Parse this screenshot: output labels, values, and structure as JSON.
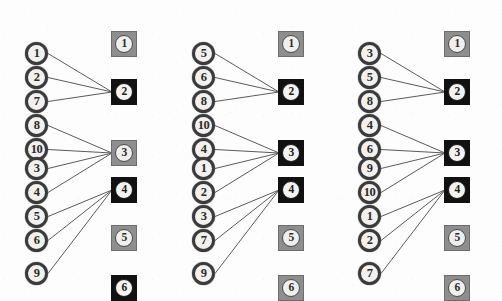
{
  "figure": {
    "type": "bipartite-matching-diagram",
    "panel_count": 3,
    "left_node_shape": "circle",
    "right_node_shape": "square",
    "colors": {
      "node_fill": "#f2f1ef",
      "node_border": "#3b3b3b",
      "square_gray": "#8e8e8e",
      "square_black": "#111111",
      "edge": "#5a5a5a",
      "background": "#ffffff"
    },
    "geometry": {
      "canvas_width": 502,
      "canvas_height": 301,
      "panel_x_offsets": [
        0,
        167,
        333
      ],
      "left_node_x": 25,
      "left_node_y": [
        42,
        66,
        90,
        114,
        138,
        157,
        181,
        205,
        229,
        262
      ],
      "square_x": 111,
      "square_y": [
        31,
        79,
        140,
        177,
        225,
        275
      ]
    }
  },
  "panels": [
    {
      "id": "panel-1",
      "left_nodes": [
        {
          "label": "1"
        },
        {
          "label": "2"
        },
        {
          "label": "7"
        },
        {
          "label": "8"
        },
        {
          "label": "10"
        },
        {
          "label": "3"
        },
        {
          "label": "4"
        },
        {
          "label": "5"
        },
        {
          "label": "6"
        },
        {
          "label": "9"
        }
      ],
      "squares": [
        {
          "label": "1",
          "style": "gray"
        },
        {
          "label": "2",
          "style": "black"
        },
        {
          "label": "3",
          "style": "gray"
        },
        {
          "label": "4",
          "style": "black"
        },
        {
          "label": "5",
          "style": "gray"
        },
        {
          "label": "6",
          "style": "black"
        }
      ],
      "edges": [
        {
          "from": 0,
          "to": 1
        },
        {
          "from": 1,
          "to": 1
        },
        {
          "from": 2,
          "to": 1
        },
        {
          "from": 3,
          "to": 2
        },
        {
          "from": 4,
          "to": 2
        },
        {
          "from": 5,
          "to": 2
        },
        {
          "from": 6,
          "to": 2
        },
        {
          "from": 7,
          "to": 3
        },
        {
          "from": 8,
          "to": 3
        },
        {
          "from": 9,
          "to": 3
        }
      ]
    },
    {
      "id": "panel-2",
      "left_nodes": [
        {
          "label": "5"
        },
        {
          "label": "6"
        },
        {
          "label": "8"
        },
        {
          "label": "10"
        },
        {
          "label": "4"
        },
        {
          "label": "1"
        },
        {
          "label": "2"
        },
        {
          "label": "3"
        },
        {
          "label": "7"
        },
        {
          "label": "9"
        }
      ],
      "squares": [
        {
          "label": "1",
          "style": "gray"
        },
        {
          "label": "2",
          "style": "black"
        },
        {
          "label": "3",
          "style": "black"
        },
        {
          "label": "4",
          "style": "black"
        },
        {
          "label": "5",
          "style": "gray"
        },
        {
          "label": "6",
          "style": "gray"
        }
      ],
      "edges": [
        {
          "from": 0,
          "to": 1
        },
        {
          "from": 1,
          "to": 1
        },
        {
          "from": 2,
          "to": 1
        },
        {
          "from": 3,
          "to": 2
        },
        {
          "from": 4,
          "to": 2
        },
        {
          "from": 5,
          "to": 2
        },
        {
          "from": 6,
          "to": 2
        },
        {
          "from": 7,
          "to": 3
        },
        {
          "from": 8,
          "to": 3
        },
        {
          "from": 9,
          "to": 3
        }
      ]
    },
    {
      "id": "panel-3",
      "left_nodes": [
        {
          "label": "3"
        },
        {
          "label": "5"
        },
        {
          "label": "8"
        },
        {
          "label": "4"
        },
        {
          "label": "6"
        },
        {
          "label": "9"
        },
        {
          "label": "10"
        },
        {
          "label": "1"
        },
        {
          "label": "2"
        },
        {
          "label": "7"
        }
      ],
      "squares": [
        {
          "label": "1",
          "style": "gray"
        },
        {
          "label": "2",
          "style": "black"
        },
        {
          "label": "3",
          "style": "black"
        },
        {
          "label": "4",
          "style": "black"
        },
        {
          "label": "5",
          "style": "gray"
        },
        {
          "label": "6",
          "style": "gray"
        }
      ],
      "edges": [
        {
          "from": 0,
          "to": 1
        },
        {
          "from": 1,
          "to": 1
        },
        {
          "from": 2,
          "to": 1
        },
        {
          "from": 3,
          "to": 2
        },
        {
          "from": 4,
          "to": 2
        },
        {
          "from": 5,
          "to": 2
        },
        {
          "from": 6,
          "to": 2
        },
        {
          "from": 7,
          "to": 3
        },
        {
          "from": 8,
          "to": 3
        },
        {
          "from": 9,
          "to": 3
        }
      ]
    }
  ]
}
